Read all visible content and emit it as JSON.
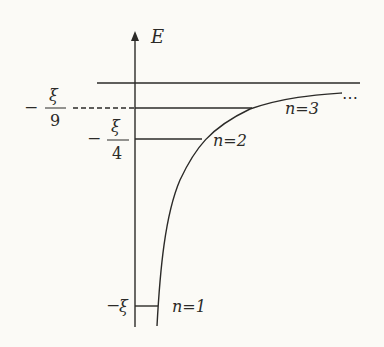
{
  "diagram": {
    "axis": {
      "label": "E"
    },
    "levels": [
      {
        "n": "n=1",
        "value_label": "ξ",
        "sign": "−",
        "denominator": ""
      },
      {
        "n": "n=2",
        "value_label": "ξ",
        "sign": "−",
        "denominator": "4"
      },
      {
        "n": "n=3",
        "value_label": "ξ",
        "sign": "−",
        "denominator": "9"
      }
    ],
    "ellipsis": "⋯",
    "colors": {
      "line": "#2b2a28",
      "background": "#fbfaf6"
    }
  }
}
